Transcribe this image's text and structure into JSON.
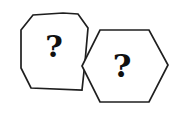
{
  "canvas": {
    "width": 185,
    "height": 117,
    "background_color": "#ffffff"
  },
  "style": {
    "stroke_color": "#1f1f1f",
    "stroke_width": 1.7,
    "glyph_color": "#101010",
    "fill_color": "#ffffff"
  },
  "figure": {
    "shapes": [
      {
        "id": "octagon",
        "name": "left-octagon",
        "sides": 8,
        "label": "?",
        "label_x": 54,
        "label_y": 46,
        "label_size": 30,
        "points": "21,30 33,15 63,13 78,14 88,28 85,62 82,90 31,88 21,68",
        "z": 1
      },
      {
        "id": "hexagon",
        "name": "right-hexagon",
        "sides": 6,
        "label": "?",
        "label_x": 122,
        "label_y": 66,
        "label_size": 32,
        "points": "100,30 149,30 168,65 149,102 100,102 82,66",
        "z": 2
      }
    ]
  }
}
